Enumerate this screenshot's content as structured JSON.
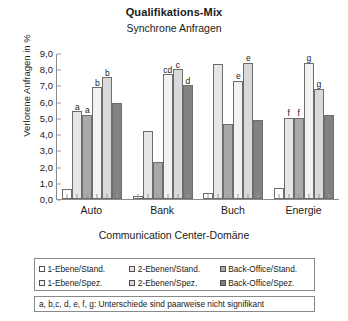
{
  "chart_data": {
    "type": "bar",
    "title": "Qualifikations-Mix",
    "subtitle": "Synchrone Anfragen",
    "xlabel": "Communication Center-Domäne",
    "ylabel": "Verlorene Anfragen in %",
    "ylim": [
      0,
      9
    ],
    "yticks": [
      "0,0",
      "1,0",
      "2,0",
      "3,0",
      "4,0",
      "5,0",
      "6,0",
      "7,0",
      "8,0",
      "9,0"
    ],
    "grid": false,
    "legend_position": "bottom",
    "categories": [
      "Auto",
      "Bank",
      "Buch",
      "Energie"
    ],
    "series": [
      {
        "name": "1-Ebene/Stand.",
        "color": "#ffffff",
        "values": [
          0.6,
          0.2,
          0.4,
          0.7
        ]
      },
      {
        "name": "2-Ebenen/Stand.",
        "color": "#e6e6e6",
        "values": [
          5.4,
          4.2,
          8.3,
          5.0
        ]
      },
      {
        "name": "Back-Office/Stand.",
        "color": "#a9a9a9",
        "values": [
          5.2,
          2.3,
          4.6,
          5.0
        ]
      },
      {
        "name": "1-Ebene/Spez.",
        "color": "#f2f2f2",
        "values": [
          6.9,
          7.7,
          7.3,
          8.4
        ]
      },
      {
        "name": "2-Ebenen/Spez.",
        "color": "#d9d9d9",
        "values": [
          7.5,
          8.0,
          8.4,
          6.8
        ]
      },
      {
        "name": "Back-Office/Spez.",
        "color": "#828282",
        "values": [
          5.9,
          7.0,
          4.9,
          5.2
        ]
      }
    ],
    "annotations": [
      {
        "group": 0,
        "series": 1,
        "text": "a"
      },
      {
        "group": 0,
        "series": 2,
        "text": "a"
      },
      {
        "group": 0,
        "series": 3,
        "text": "b"
      },
      {
        "group": 0,
        "series": 4,
        "text": "b"
      },
      {
        "group": 1,
        "series": 3,
        "text": "cd"
      },
      {
        "group": 1,
        "series": 4,
        "text": "c"
      },
      {
        "group": 1,
        "series": 5,
        "text": "d"
      },
      {
        "group": 2,
        "series": 3,
        "text": "e"
      },
      {
        "group": 2,
        "series": 4,
        "text": "e"
      },
      {
        "group": 3,
        "series": 1,
        "text": "f"
      },
      {
        "group": 3,
        "series": 2,
        "text": "f"
      },
      {
        "group": 3,
        "series": 3,
        "text": "g"
      },
      {
        "group": 3,
        "series": 4,
        "text": "g"
      }
    ],
    "note": "a, b,c, d, e, f, g: Unterschiede sind paarweise nicht signifikant"
  }
}
